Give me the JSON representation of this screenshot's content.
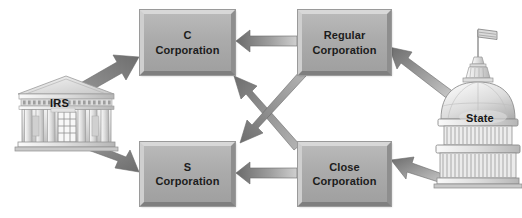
{
  "diagram": {
    "background_color": "#ffffff",
    "nodes": [
      {
        "id": "c_corporation",
        "label": "C\nCorporation",
        "line1": "C",
        "line2": "Corporation"
      },
      {
        "id": "regular_corporation",
        "label": "Regular\nCorporation",
        "line1": "Regular",
        "line2": "Corporation"
      },
      {
        "id": "s_corporation",
        "label": "S\nCorporation",
        "line1": "S",
        "line2": "Corporation"
      },
      {
        "id": "close_corporation",
        "label": "Close\nCorporation",
        "line1": "Close",
        "line2": "Corporation"
      }
    ],
    "institutions": [
      {
        "id": "irs",
        "label": "IRS",
        "icon": "classical-government-building-icon"
      },
      {
        "id": "state",
        "label": "State",
        "icon": "capitol-dome-building-icon"
      }
    ],
    "connections": [
      {
        "from": "irs",
        "to": "c_corporation",
        "direction": "up-right"
      },
      {
        "from": "irs",
        "to": "s_corporation",
        "direction": "down-right"
      },
      {
        "from": "regular_corporation",
        "to": "c_corporation",
        "direction": "left"
      },
      {
        "from": "regular_corporation",
        "to": "s_corporation",
        "direction": "down-left"
      },
      {
        "from": "close_corporation",
        "to": "s_corporation",
        "direction": "left"
      },
      {
        "from": "close_corporation",
        "to": "c_corporation",
        "direction": "up-left"
      },
      {
        "from": "state",
        "to": "regular_corporation",
        "direction": "up-left"
      },
      {
        "from": "state",
        "to": "close_corporation",
        "direction": "left"
      }
    ],
    "colors": {
      "box_fill_top": "#b9b9b9",
      "box_fill_bottom": "#a0a0a0",
      "box_bevel_light": "#d8d8d8",
      "box_bevel_dark": "#7f7f7f",
      "arrow_light": "#c8c8c8",
      "arrow_dark": "#6f6f6f",
      "text": "#1c1c1c",
      "building_light": "#e9e9e9",
      "building_mid": "#c6c6c6",
      "building_outline": "#8a8a8a"
    }
  }
}
